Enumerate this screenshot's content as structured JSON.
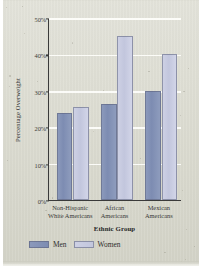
{
  "chart_data": {
    "type": "bar",
    "title": "",
    "xlabel": "Ethnic Group",
    "ylabel": "Percentage Overweight",
    "categories": [
      "Non-Hispanic White Americans",
      "African Americans",
      "Mexican Americans"
    ],
    "category_lines": [
      [
        "Non-Hispanic",
        "White Americans"
      ],
      [
        "African",
        "Americans"
      ],
      [
        "Mexican",
        "Americans"
      ]
    ],
    "series": [
      {
        "name": "Men",
        "values": [
          24,
          26.5,
          30
        ]
      },
      {
        "name": "Women",
        "values": [
          25.5,
          45,
          40
        ]
      }
    ],
    "ylim": [
      0,
      50
    ],
    "yticks": [
      0,
      10,
      20,
      30,
      40,
      50
    ],
    "ytick_labels": [
      "0%",
      "10%",
      "20%",
      "30%",
      "40%",
      "50%"
    ],
    "grid": true,
    "grid_axis": "y",
    "legend_position": "bottom-left",
    "colors": {
      "men": "#7d8cb2",
      "women": "#c2c6dd",
      "plot_background": "#dcdcd0",
      "axis": "#3a3a3a",
      "gridline": "#fdfdfa",
      "text": "#3a3a3a"
    }
  },
  "legend": {
    "items": [
      {
        "label": "Men",
        "swatch": "men-color-swatch"
      },
      {
        "label": "Women",
        "swatch": "women-color-swatch"
      }
    ]
  }
}
